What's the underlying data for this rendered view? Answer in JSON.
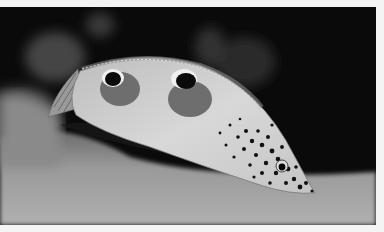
{
  "image": {
    "subject": "Spotted wrasse fish underwater",
    "tone": "grayscale",
    "alt": "Black and white photograph of a fish with two eye-spots on its dorsal side and a spotted head, swimming over sandy seabed against a dark background"
  },
  "colors": {
    "background": "#0a0a0a",
    "sand": "#9a9a9a",
    "fish_body": "#cfcfcf",
    "eyespot_patch": "#6e6e6e",
    "spots": "#111111",
    "page": "#f4f4f4"
  }
}
